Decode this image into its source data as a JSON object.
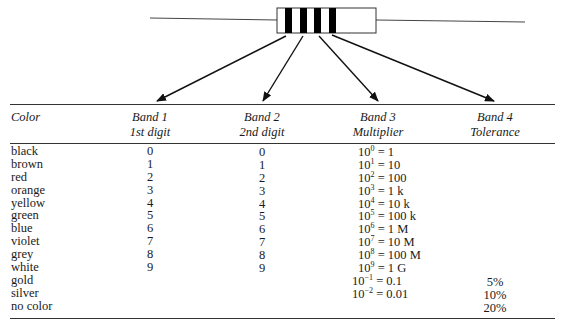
{
  "diagram": {
    "resistor": {
      "bands": 4,
      "band_color": "#000000",
      "body_fill": "#ffffff"
    },
    "arrows": [
      "Band 1",
      "Band 2",
      "Band 3",
      "Band 4"
    ]
  },
  "table": {
    "headers": [
      {
        "line1": "Color",
        "line2": ""
      },
      {
        "line1": "Band 1",
        "line2": "1st digit"
      },
      {
        "line1": "Band 2",
        "line2": "2nd digit"
      },
      {
        "line1": "Band 3",
        "line2": "Multiplier"
      },
      {
        "line1": "Band 4",
        "line2": "Tolerance"
      }
    ],
    "rows": [
      {
        "color": "black",
        "band1": "0",
        "band2": "0",
        "mult_base": "10",
        "mult_exp": "0",
        "mult_val": " = 1",
        "tol": ""
      },
      {
        "color": "brown",
        "band1": "1",
        "band2": "1",
        "mult_base": "10",
        "mult_exp": "1",
        "mult_val": " = 10",
        "tol": ""
      },
      {
        "color": "red",
        "band1": "2",
        "band2": "2",
        "mult_base": "10",
        "mult_exp": "2",
        "mult_val": " = 100",
        "tol": ""
      },
      {
        "color": "orange",
        "band1": "3",
        "band2": "3",
        "mult_base": "10",
        "mult_exp": "3",
        "mult_val": " = 1 k",
        "tol": ""
      },
      {
        "color": "yellow",
        "band1": "4",
        "band2": "4",
        "mult_base": "10",
        "mult_exp": "4",
        "mult_val": " = 10 k",
        "tol": ""
      },
      {
        "color": "green",
        "band1": "5",
        "band2": "5",
        "mult_base": "10",
        "mult_exp": "5",
        "mult_val": " = 100 k",
        "tol": ""
      },
      {
        "color": "blue",
        "band1": "6",
        "band2": "6",
        "mult_base": "10",
        "mult_exp": "6",
        "mult_val": " = 1 M",
        "tol": ""
      },
      {
        "color": "violet",
        "band1": "7",
        "band2": "7",
        "mult_base": "10",
        "mult_exp": "7",
        "mult_val": " = 10 M",
        "tol": ""
      },
      {
        "color": "grey",
        "band1": "8",
        "band2": "8",
        "mult_base": "10",
        "mult_exp": "8",
        "mult_val": " = 100 M",
        "tol": ""
      },
      {
        "color": "white",
        "band1": "9",
        "band2": "9",
        "mult_base": "10",
        "mult_exp": "9",
        "mult_val": " = 1 G",
        "tol": ""
      },
      {
        "color": "gold",
        "band1": "",
        "band2": "",
        "mult_base": "10",
        "mult_exp": "−1",
        "mult_val": " = 0.1",
        "tol": "5%"
      },
      {
        "color": "silver",
        "band1": "",
        "band2": "",
        "mult_base": "10",
        "mult_exp": "−2",
        "mult_val": " = 0.01",
        "tol": "10%"
      },
      {
        "color": "no color",
        "band1": "",
        "band2": "",
        "mult_base": "",
        "mult_exp": "",
        "mult_val": "",
        "tol": "20%"
      }
    ]
  }
}
